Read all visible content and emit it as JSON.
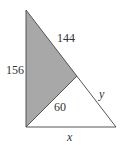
{
  "diagram": {
    "type": "geometry-triangle",
    "labels": {
      "left_side": "156",
      "upper_hypotenuse": "144",
      "inner_segment": "60",
      "lower_hypotenuse": "y",
      "base": "x"
    },
    "colors": {
      "shaded_fill": "#a8a8a8",
      "stroke": "#555555",
      "background": "#ffffff"
    }
  }
}
